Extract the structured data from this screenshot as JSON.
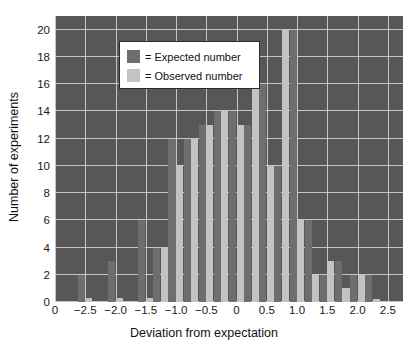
{
  "chart_data": {
    "type": "bar",
    "title": "",
    "xlabel": "Deviation from expectation",
    "ylabel": "Number of experiments",
    "xlim": [
      -3.0,
      2.75
    ],
    "ylim": [
      0,
      21
    ],
    "yticks": [
      0,
      2,
      4,
      6,
      8,
      10,
      12,
      14,
      16,
      18,
      20
    ],
    "xticks": [
      -3.0,
      -2.5,
      -2.0,
      -1.5,
      -1.0,
      -0.5,
      0,
      0.5,
      1.0,
      1.5,
      2.0,
      2.5
    ],
    "xticklabels": [
      "0",
      "−2.5",
      "−2.0",
      "−1.5",
      "−1.0",
      "−0.5",
      "0",
      "0.5",
      "1.0",
      "1.5",
      "2.0",
      "2.5"
    ],
    "grid": true,
    "legend_position": "upper-left",
    "bin_width": 0.25,
    "categories": [
      -2.75,
      -2.5,
      -2.25,
      -2.0,
      -1.75,
      -1.5,
      -1.25,
      -1.0,
      -0.75,
      -0.5,
      -0.25,
      0,
      0.25,
      0.5,
      0.75,
      1.0,
      1.25,
      1.5,
      1.75,
      2.0,
      2.25,
      2.5
    ],
    "series": [
      {
        "name": "Expected number",
        "color": "#6e6e6e",
        "values": [
          0,
          2,
          0,
          3,
          0,
          6,
          4,
          12,
          12,
          13,
          14,
          14,
          13,
          16,
          10,
          20,
          6,
          2,
          3,
          2,
          2,
          0
        ]
      },
      {
        "name": "Observed number",
        "color": "#c3c3c3",
        "values": [
          0,
          0.3,
          0,
          0.3,
          0,
          0.3,
          4,
          10,
          12,
          13,
          14,
          13,
          16,
          10,
          20,
          6,
          2,
          3,
          1,
          2,
          0.2,
          0
        ]
      }
    ]
  },
  "legend": {
    "items": [
      {
        "swatch": "expected-swatch",
        "label": "= Expected number"
      },
      {
        "swatch": "observed-swatch",
        "label": "= Observed number"
      }
    ]
  },
  "colors": {
    "plot_background": "#575757",
    "grid": "#d8d8d8",
    "expected": "#6e6e6e",
    "observed": "#c3c3c3",
    "text": "#111111",
    "legend_background": "#ffffff",
    "legend_border": "#2b2b2b"
  }
}
